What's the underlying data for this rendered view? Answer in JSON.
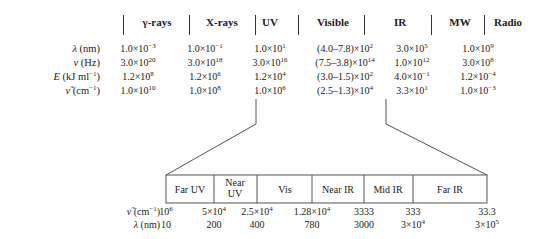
{
  "top_table": {
    "headers": [
      "γ-rays",
      "X-rays",
      "UV",
      "Visible",
      "IR",
      "MW",
      "Radio"
    ],
    "row_labels": [
      {
        "sym": "λ",
        "unit": " (nm)"
      },
      {
        "sym": "ν",
        "unit": " (Hz)"
      },
      {
        "sym": "E",
        "unit": " (kJ ml",
        "sup": "−1",
        "tail": ")"
      },
      {
        "sym": "ν̃",
        "unit": " (cm",
        "sup": "−1",
        "tail": ")"
      }
    ],
    "rows": [
      [
        [
          "1.0×10",
          "−3"
        ],
        [
          "1.0×10",
          "−1"
        ],
        [
          "1.0×10",
          "1"
        ],
        [
          "(4.0–7.8)×10",
          "2"
        ],
        [
          "3.0×10",
          "5"
        ],
        [
          "1.0×10",
          "9"
        ]
      ],
      [
        [
          "3.0×10",
          "20"
        ],
        [
          "3.0×10",
          "18"
        ],
        [
          "3.0×10",
          "16"
        ],
        [
          "(7.5–3.8)×10",
          "14"
        ],
        [
          "1.0×10",
          "12"
        ],
        [
          "3.0×10",
          "8"
        ]
      ],
      [
        [
          "1.2×10",
          "8"
        ],
        [
          "1.2×10",
          "6"
        ],
        [
          "1.2×10",
          "4"
        ],
        [
          "(3.0–1.5)×10",
          "2"
        ],
        [
          "4.0×10",
          "−1"
        ],
        [
          "1.2×10",
          "−4"
        ]
      ],
      [
        [
          "1.0×10",
          "10"
        ],
        [
          "1.0×10",
          "8"
        ],
        [
          "1.0×10",
          "6"
        ],
        [
          "(2.5–1.3)×10",
          "4"
        ],
        [
          "3.3×10",
          "1"
        ],
        [
          "1.0×10",
          "−3"
        ]
      ]
    ]
  },
  "detail": {
    "regions": [
      "Far UV",
      "Near UV",
      "Vis",
      "Near IR",
      "Mid IR",
      "Far IR"
    ],
    "wavenumber_label": {
      "sym": "ν̃",
      "unit": " (cm",
      "sup": "−1",
      "tail": ")"
    },
    "wavelength_label": {
      "sym": "λ",
      "unit": " (nm)"
    },
    "wavenumbers": [
      [
        "10",
        "6"
      ],
      [
        "5×10",
        "4"
      ],
      [
        "2.5×10",
        "4"
      ],
      [
        "1.28×10",
        "4"
      ],
      [
        "3333",
        ""
      ],
      [
        "333",
        ""
      ],
      [
        "33.3",
        ""
      ]
    ],
    "wavelengths": [
      [
        "10",
        ""
      ],
      [
        "200",
        ""
      ],
      [
        "400",
        ""
      ],
      [
        "780",
        ""
      ],
      [
        "3000",
        ""
      ],
      [
        "3×10",
        "4"
      ],
      [
        "3×10",
        "5"
      ]
    ]
  },
  "colors": {
    "line": "#444444",
    "text": "#222222",
    "background": "#ffffff"
  }
}
